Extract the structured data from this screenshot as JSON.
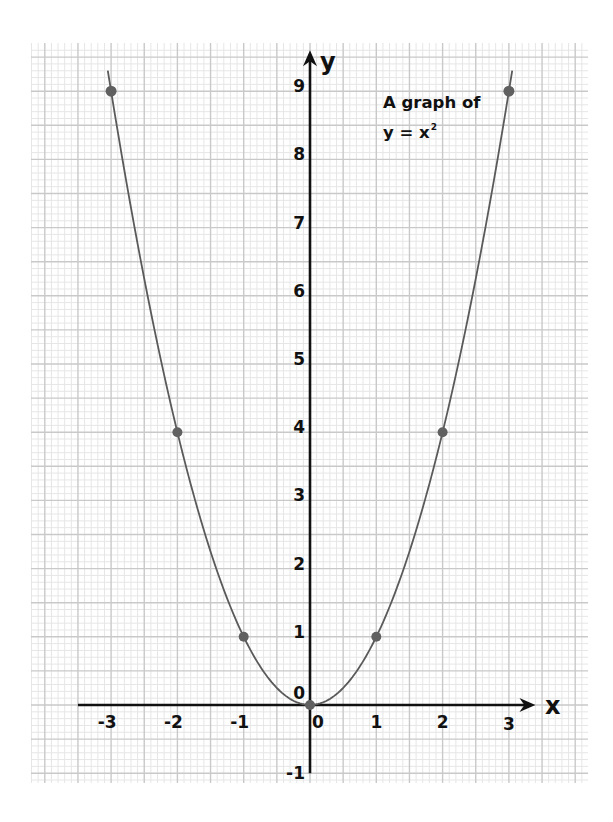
{
  "chart_data": {
    "type": "line",
    "title_lines": [
      "A graph of",
      "y = x"
    ],
    "title_superscript": "2",
    "xlabel": "x",
    "ylabel": "y",
    "x": [
      -3,
      -2,
      -1,
      0,
      1,
      2,
      3
    ],
    "series": [
      {
        "name": "y = x^2",
        "values": [
          9,
          4,
          1,
          0,
          1,
          4,
          9
        ],
        "markers": true,
        "smooth_curve": true,
        "curve_extends_to_x": [
          -3.05,
          3.05
        ]
      }
    ],
    "x_ticks": [
      -3,
      -2,
      -1,
      0,
      1,
      2,
      3
    ],
    "x_tick_labels": [
      "-3",
      "-2",
      "-1",
      "0",
      "1",
      "2",
      "3"
    ],
    "y_ticks": [
      -1,
      0,
      1,
      2,
      3,
      4,
      5,
      6,
      7,
      8,
      9
    ],
    "y_tick_labels": [
      "-1",
      "0",
      "1",
      "2",
      "3",
      "4",
      "5",
      "6",
      "7",
      "8",
      "9"
    ],
    "xlim": [
      -4.2,
      4.2
    ],
    "ylim": [
      -1.15,
      9.7
    ],
    "x_axis_range": [
      -3.5,
      3.4
    ],
    "y_axis_range": [
      -1,
      9.6
    ],
    "grid": {
      "on": true,
      "major_step": 0.5,
      "minor_step": 0.1,
      "style": "graph paper"
    },
    "legend": null,
    "colors": {
      "curve": "#5a5a5a",
      "points": "#606060",
      "axes": "#111111",
      "grid_major": "#c9c9c9",
      "grid_minor": "#e6e6e6",
      "background": "#ffffff"
    }
  },
  "layout": {
    "origin_px": [
      310,
      705
    ],
    "unit_px": [
      66.3,
      68.2
    ],
    "grid_box_px": {
      "left": 31,
      "right": 588,
      "top": 43,
      "bottom": 783
    }
  }
}
